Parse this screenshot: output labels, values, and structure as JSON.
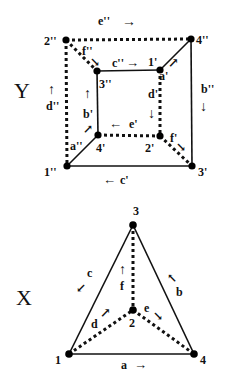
{
  "graphs": [
    {
      "name": "Y",
      "title": "Y",
      "nodes": [
        {
          "id": "2''",
          "label": "2''",
          "x": 66,
          "y": 40
        },
        {
          "id": "4''",
          "label": "4''",
          "x": 191,
          "y": 39
        },
        {
          "id": "3''",
          "label": "3''",
          "x": 97,
          "y": 71
        },
        {
          "id": "1'",
          "label": "1'",
          "x": 160,
          "y": 70
        },
        {
          "id": "4'",
          "label": "4'",
          "x": 98,
          "y": 135
        },
        {
          "id": "2'",
          "label": "2'",
          "x": 160,
          "y": 136
        },
        {
          "id": "1''",
          "label": "1''",
          "x": 67,
          "y": 166
        },
        {
          "id": "3'",
          "label": "3'",
          "x": 192,
          "y": 166
        }
      ],
      "edges": [
        {
          "from": "2''",
          "to": "4''",
          "style": "dashed",
          "label": "e''",
          "arrow": "→"
        },
        {
          "from": "2''",
          "to": "3''",
          "style": "dashed",
          "label": "f''",
          "arrow": "↘"
        },
        {
          "from": "3''",
          "to": "1'",
          "style": "solid",
          "label": "c''",
          "arrow": "→"
        },
        {
          "from": "1'",
          "to": "4''",
          "style": "solid",
          "label": "a'",
          "arrow": "↗"
        },
        {
          "from": "4''",
          "to": "3'",
          "style": "solid",
          "label": "b''",
          "arrow": "↓"
        },
        {
          "from": "2''",
          "to": "1''",
          "style": "dashed",
          "label": "d''",
          "arrow": "↑"
        },
        {
          "from": "4'",
          "to": "3''",
          "style": "solid",
          "label": "b'",
          "arrow": "↑"
        },
        {
          "from": "1'",
          "to": "2'",
          "style": "dashed",
          "label": "d'",
          "arrow": "↓"
        },
        {
          "from": "2'",
          "to": "4'",
          "style": "dashed",
          "label": "e'",
          "arrow": "←"
        },
        {
          "from": "1''",
          "to": "4'",
          "style": "solid",
          "label": "a''",
          "arrow": "↗"
        },
        {
          "from": "2'",
          "to": "3'",
          "style": "dashed",
          "label": "f'",
          "arrow": "↘"
        },
        {
          "from": "3'",
          "to": "1''",
          "style": "solid",
          "label": "c'",
          "arrow": "←"
        }
      ]
    },
    {
      "name": "X",
      "title": "X",
      "nodes": [
        {
          "id": "3",
          "label": "3",
          "x": 133,
          "y": 225
        },
        {
          "id": "2",
          "label": "2",
          "x": 133,
          "y": 310
        },
        {
          "id": "1",
          "label": "1",
          "x": 69,
          "y": 354
        },
        {
          "id": "4",
          "label": "4",
          "x": 194,
          "y": 354
        }
      ],
      "edges": [
        {
          "from": "3",
          "to": "1",
          "style": "solid",
          "label": "c",
          "arrow": "↙"
        },
        {
          "from": "4",
          "to": "3",
          "style": "solid",
          "label": "b",
          "arrow": "↖"
        },
        {
          "from": "1",
          "to": "4",
          "style": "solid",
          "label": "a",
          "arrow": "→"
        },
        {
          "from": "2",
          "to": "3",
          "style": "dashed",
          "label": "f",
          "arrow": "↑"
        },
        {
          "from": "1",
          "to": "2",
          "style": "dashed",
          "label": "d",
          "arrow": "↗"
        },
        {
          "from": "2",
          "to": "4",
          "style": "dashed",
          "label": "e",
          "arrow": "↘"
        }
      ]
    }
  ]
}
